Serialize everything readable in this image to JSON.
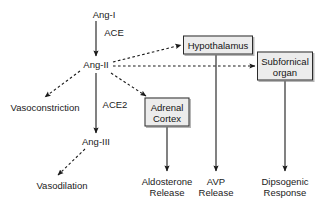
{
  "diagram": {
    "colors": {
      "background": "#ffffff",
      "box_fill": "#ececec",
      "box_border": "#2b2b2b",
      "line": "#1a1a1a",
      "text": "#141414"
    },
    "plain_nodes": [
      {
        "id": "ang-i",
        "label": "Ang-I",
        "x": 104,
        "y": 14
      },
      {
        "id": "ang-ii",
        "label": "Ang-II",
        "x": 96,
        "y": 64
      },
      {
        "id": "ang-iii",
        "label": "Ang-III",
        "x": 96,
        "y": 141
      },
      {
        "id": "vasoconstriction",
        "label": "Vasoconstriction",
        "x": 45,
        "y": 107
      },
      {
        "id": "vasodilation",
        "label": "Vasodilation",
        "x": 62,
        "y": 185
      }
    ],
    "boxed_nodes": [
      {
        "id": "hypothalamus",
        "lines": [
          "Hypothalamus"
        ],
        "x": 218,
        "y": 45,
        "w": 70,
        "h": 19
      },
      {
        "id": "subfornical-organ",
        "lines": [
          "Subfornical",
          "organ"
        ],
        "x": 285,
        "y": 66,
        "w": 56,
        "h": 29
      },
      {
        "id": "adrenal-cortex",
        "lines": [
          "Adrenal",
          "Cortex"
        ],
        "x": 167,
        "y": 112,
        "w": 45,
        "h": 29
      }
    ],
    "outcome_nodes": [
      {
        "id": "aldosterone-release",
        "lines": [
          "Aldosterone",
          "Release"
        ],
        "x": 167,
        "y": 187
      },
      {
        "id": "avp-release",
        "lines": [
          "AVP",
          "Release"
        ],
        "x": 216,
        "y": 187
      },
      {
        "id": "dipsogenic-response",
        "lines": [
          "Dipsogenic",
          "Response"
        ],
        "x": 285,
        "y": 187
      }
    ],
    "edge_labels": [
      {
        "id": "ace",
        "label": "ACE",
        "x": 114,
        "y": 32
      },
      {
        "id": "ace2",
        "label": "ACE2",
        "x": 115,
        "y": 104
      }
    ],
    "edges": [
      {
        "id": "ang-i-to-ang-ii",
        "style": "solid",
        "from": "ang-i",
        "to": "ang-ii"
      },
      {
        "id": "ang-ii-to-ang-iii",
        "style": "solid",
        "from": "ang-ii",
        "to": "ang-iii"
      },
      {
        "id": "ang-ii-to-vasoconstriction",
        "style": "dashed",
        "from": "ang-ii",
        "to": "vasoconstriction"
      },
      {
        "id": "ang-iii-to-vasodilation",
        "style": "dashed",
        "from": "ang-iii",
        "to": "vasodilation"
      },
      {
        "id": "ang-ii-to-hypothalamus",
        "style": "dashed",
        "from": "ang-ii",
        "to": "hypothalamus"
      },
      {
        "id": "ang-ii-to-subfornical-organ",
        "style": "dashed",
        "from": "ang-ii",
        "to": "subfornical-organ"
      },
      {
        "id": "ang-ii-to-adrenal-cortex",
        "style": "dashed",
        "from": "ang-ii",
        "to": "adrenal-cortex"
      },
      {
        "id": "adrenal-cortex-to-aldosterone",
        "style": "solid",
        "from": "adrenal-cortex",
        "to": "aldosterone-release"
      },
      {
        "id": "hypothalamus-to-avp",
        "style": "solid",
        "from": "hypothalamus",
        "to": "avp-release"
      },
      {
        "id": "subfornical-organ-to-dipsogenic",
        "style": "solid",
        "from": "subfornical-organ",
        "to": "dipsogenic-response"
      }
    ]
  }
}
